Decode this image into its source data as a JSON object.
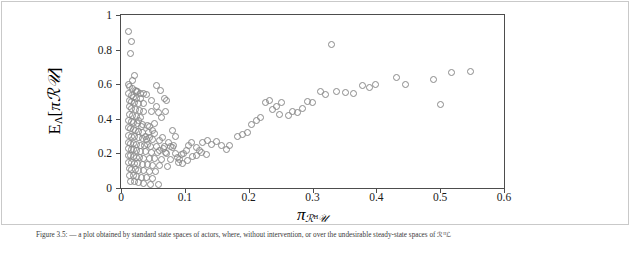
{
  "figure": {
    "caption": "Figure 3.5:  — a plot obtained by standard state spaces of actors, where, without intervention, or over the undesirable steady-state spaces of ℛᴴ",
    "caption_tail": "ℒ"
  },
  "chart_data": {
    "type": "scatter",
    "title": "",
    "xlabel": "π_{ℛ^{H}ᵁ2}",
    "xlabel_parts": {
      "base": "π",
      "sub_main": "ℛ",
      "sub_sup": "H",
      "sub_tail": "𝒰"
    },
    "ylabel": "E_{Λ}[πℛᵁ2]",
    "ylabel_parts": {
      "base": "E",
      "sub": "Λ",
      "bracket_open": "[",
      "inner": "πℛ𝒰",
      "bracket_close": "]"
    },
    "xlim": [
      0,
      0.6
    ],
    "ylim": [
      0,
      1
    ],
    "xticks": [
      0,
      0.1,
      0.2,
      0.3,
      0.4,
      0.5,
      0.6
    ],
    "xticklabels": [
      "0",
      "0.1",
      "0.2",
      "0.3",
      "0.4",
      "0.5",
      "0.6"
    ],
    "yticks": [
      0,
      0.2,
      0.4,
      0.6,
      0.8,
      1
    ],
    "yticklabels": [
      "0",
      "0.2",
      "0.4",
      "0.6",
      "0.8",
      "1"
    ],
    "grid": false,
    "legend": null,
    "marker": {
      "shape": "circle-open",
      "color": "#8a8a8a",
      "size": 7
    },
    "points": [
      [
        0.012,
        0.905
      ],
      [
        0.016,
        0.845
      ],
      [
        0.015,
        0.775
      ],
      [
        0.012,
        0.6
      ],
      [
        0.014,
        0.585
      ],
      [
        0.018,
        0.575
      ],
      [
        0.022,
        0.565
      ],
      [
        0.026,
        0.555
      ],
      [
        0.031,
        0.548
      ],
      [
        0.036,
        0.545
      ],
      [
        0.04,
        0.54
      ],
      [
        0.012,
        0.545
      ],
      [
        0.016,
        0.535
      ],
      [
        0.02,
        0.525
      ],
      [
        0.024,
        0.52
      ],
      [
        0.013,
        0.505
      ],
      [
        0.017,
        0.5
      ],
      [
        0.021,
        0.495
      ],
      [
        0.027,
        0.49
      ],
      [
        0.055,
        0.59
      ],
      [
        0.062,
        0.565
      ],
      [
        0.068,
        0.52
      ],
      [
        0.072,
        0.505
      ],
      [
        0.013,
        0.47
      ],
      [
        0.017,
        0.462
      ],
      [
        0.022,
        0.455
      ],
      [
        0.029,
        0.45
      ],
      [
        0.036,
        0.445
      ],
      [
        0.048,
        0.44
      ],
      [
        0.058,
        0.435
      ],
      [
        0.013,
        0.425
      ],
      [
        0.018,
        0.418
      ],
      [
        0.024,
        0.412
      ],
      [
        0.031,
        0.405
      ],
      [
        0.012,
        0.392
      ],
      [
        0.016,
        0.385
      ],
      [
        0.02,
        0.378
      ],
      [
        0.026,
        0.372
      ],
      [
        0.033,
        0.368
      ],
      [
        0.041,
        0.362
      ],
      [
        0.012,
        0.35
      ],
      [
        0.015,
        0.345
      ],
      [
        0.019,
        0.338
      ],
      [
        0.023,
        0.332
      ],
      [
        0.028,
        0.328
      ],
      [
        0.034,
        0.322
      ],
      [
        0.043,
        0.318
      ],
      [
        0.052,
        0.314
      ],
      [
        0.012,
        0.305
      ],
      [
        0.016,
        0.3
      ],
      [
        0.021,
        0.295
      ],
      [
        0.027,
        0.29
      ],
      [
        0.033,
        0.286
      ],
      [
        0.04,
        0.282
      ],
      [
        0.05,
        0.278
      ],
      [
        0.06,
        0.275
      ],
      [
        0.012,
        0.265
      ],
      [
        0.015,
        0.26
      ],
      [
        0.019,
        0.256
      ],
      [
        0.024,
        0.252
      ],
      [
        0.03,
        0.248
      ],
      [
        0.037,
        0.245
      ],
      [
        0.046,
        0.242
      ],
      [
        0.056,
        0.24
      ],
      [
        0.068,
        0.238
      ],
      [
        0.08,
        0.236
      ],
      [
        0.012,
        0.228
      ],
      [
        0.016,
        0.224
      ],
      [
        0.02,
        0.22
      ],
      [
        0.025,
        0.216
      ],
      [
        0.031,
        0.212
      ],
      [
        0.038,
        0.21
      ],
      [
        0.047,
        0.208
      ],
      [
        0.057,
        0.206
      ],
      [
        0.07,
        0.204
      ],
      [
        0.085,
        0.202
      ],
      [
        0.098,
        0.2
      ],
      [
        0.012,
        0.19
      ],
      [
        0.015,
        0.186
      ],
      [
        0.019,
        0.182
      ],
      [
        0.024,
        0.178
      ],
      [
        0.029,
        0.175
      ],
      [
        0.036,
        0.172
      ],
      [
        0.044,
        0.17
      ],
      [
        0.053,
        0.168
      ],
      [
        0.064,
        0.166
      ],
      [
        0.078,
        0.164
      ],
      [
        0.092,
        0.162
      ],
      [
        0.012,
        0.15
      ],
      [
        0.016,
        0.146
      ],
      [
        0.021,
        0.142
      ],
      [
        0.026,
        0.139
      ],
      [
        0.033,
        0.136
      ],
      [
        0.041,
        0.133
      ],
      [
        0.05,
        0.131
      ],
      [
        0.061,
        0.129
      ],
      [
        0.073,
        0.127
      ],
      [
        0.013,
        0.112
      ],
      [
        0.017,
        0.108
      ],
      [
        0.022,
        0.105
      ],
      [
        0.028,
        0.102
      ],
      [
        0.035,
        0.099
      ],
      [
        0.044,
        0.096
      ],
      [
        0.054,
        0.094
      ],
      [
        0.014,
        0.075
      ],
      [
        0.019,
        0.07
      ],
      [
        0.025,
        0.066
      ],
      [
        0.032,
        0.062
      ],
      [
        0.04,
        0.058
      ],
      [
        0.05,
        0.055
      ],
      [
        0.015,
        0.04
      ],
      [
        0.021,
        0.035
      ],
      [
        0.028,
        0.03
      ],
      [
        0.036,
        0.026
      ],
      [
        0.046,
        0.022
      ],
      [
        0.058,
        0.018
      ],
      [
        0.088,
        0.178
      ],
      [
        0.094,
        0.196
      ],
      [
        0.102,
        0.216
      ],
      [
        0.105,
        0.248
      ],
      [
        0.11,
        0.262
      ],
      [
        0.118,
        0.236
      ],
      [
        0.123,
        0.218
      ],
      [
        0.128,
        0.262
      ],
      [
        0.136,
        0.272
      ],
      [
        0.142,
        0.252
      ],
      [
        0.15,
        0.268
      ],
      [
        0.158,
        0.248
      ],
      [
        0.165,
        0.225
      ],
      [
        0.17,
        0.248
      ],
      [
        0.182,
        0.3
      ],
      [
        0.19,
        0.312
      ],
      [
        0.198,
        0.32
      ],
      [
        0.205,
        0.368
      ],
      [
        0.212,
        0.392
      ],
      [
        0.218,
        0.41
      ],
      [
        0.226,
        0.492
      ],
      [
        0.232,
        0.508
      ],
      [
        0.238,
        0.452
      ],
      [
        0.243,
        0.47
      ],
      [
        0.249,
        0.423
      ],
      [
        0.252,
        0.495
      ],
      [
        0.262,
        0.418
      ],
      [
        0.268,
        0.445
      ],
      [
        0.276,
        0.435
      ],
      [
        0.284,
        0.458
      ],
      [
        0.292,
        0.5
      ],
      [
        0.3,
        0.492
      ],
      [
        0.312,
        0.555
      ],
      [
        0.32,
        0.54
      ],
      [
        0.33,
        0.828
      ],
      [
        0.338,
        0.56
      ],
      [
        0.352,
        0.552
      ],
      [
        0.364,
        0.548
      ],
      [
        0.378,
        0.59
      ],
      [
        0.39,
        0.58
      ],
      [
        0.398,
        0.6
      ],
      [
        0.432,
        0.64
      ],
      [
        0.446,
        0.6
      ],
      [
        0.49,
        0.625
      ],
      [
        0.5,
        0.485
      ],
      [
        0.548,
        0.672
      ],
      [
        0.518,
        0.67
      ],
      [
        0.06,
        0.215
      ],
      [
        0.066,
        0.228
      ],
      [
        0.072,
        0.198
      ],
      [
        0.078,
        0.24
      ],
      [
        0.045,
        0.29
      ],
      [
        0.05,
        0.33
      ],
      [
        0.042,
        0.25
      ],
      [
        0.038,
        0.3
      ],
      [
        0.032,
        0.355
      ],
      [
        0.028,
        0.39
      ],
      [
        0.044,
        0.355
      ],
      [
        0.052,
        0.375
      ],
      [
        0.065,
        0.29
      ],
      [
        0.075,
        0.262
      ],
      [
        0.082,
        0.248
      ],
      [
        0.09,
        0.15
      ],
      [
        0.097,
        0.142
      ],
      [
        0.104,
        0.16
      ],
      [
        0.112,
        0.182
      ],
      [
        0.118,
        0.19
      ],
      [
        0.126,
        0.205
      ],
      [
        0.134,
        0.195
      ],
      [
        0.048,
        0.505
      ],
      [
        0.056,
        0.47
      ],
      [
        0.036,
        0.49
      ],
      [
        0.03,
        0.52
      ],
      [
        0.024,
        0.56
      ],
      [
        0.018,
        0.62
      ],
      [
        0.021,
        0.65
      ],
      [
        0.064,
        0.41
      ],
      [
        0.07,
        0.44
      ],
      [
        0.08,
        0.33
      ],
      [
        0.086,
        0.3
      ]
    ]
  }
}
